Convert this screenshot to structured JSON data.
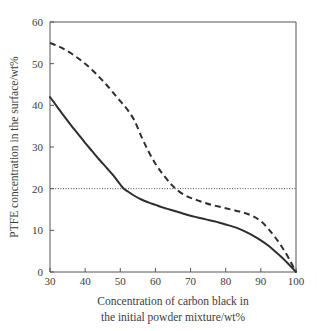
{
  "chart_data": {
    "type": "line",
    "title": "",
    "subtitle": "",
    "xlabel_line1": "Concentration of carbon black in",
    "xlabel_line2": "the initial powder mixture/wt%",
    "ylabel": "PTFE concentration in the surface/wt%",
    "xlim": [
      30,
      100
    ],
    "ylim": [
      0,
      60
    ],
    "xticks": [
      30,
      40,
      50,
      60,
      70,
      80,
      90,
      100
    ],
    "yticks": [
      0,
      10,
      20,
      30,
      40,
      50,
      60
    ],
    "xticklabels": [
      "30",
      "40",
      "50",
      "60",
      "70",
      "80",
      "90",
      "100"
    ],
    "yticklabels": [
      "0",
      "10",
      "20",
      "30",
      "40",
      "50",
      "60"
    ],
    "grid": false,
    "legend": "none",
    "annotations": [
      {
        "name": "reference-line-20",
        "kind": "horizontal-dotted-line",
        "y": 20,
        "label": ""
      }
    ],
    "series": [
      {
        "name": "dashed-curve",
        "style": "dashed",
        "color": "#2e2e2e",
        "x": [
          30,
          32,
          34,
          36,
          38,
          40,
          42,
          44,
          46,
          48,
          50,
          52,
          54,
          56,
          58,
          60,
          62,
          64,
          65,
          66,
          68,
          70,
          72,
          74,
          76,
          78,
          80,
          82,
          84,
          86,
          88,
          90,
          92,
          94,
          96,
          98,
          100
        ],
        "y": [
          55.0,
          54.3,
          53.5,
          52.5,
          51.3,
          50.0,
          48.5,
          46.8,
          45.0,
          43.0,
          41.0,
          39.0,
          36.4,
          32.5,
          29.0,
          26.0,
          23.6,
          21.5,
          20.6,
          19.8,
          18.6,
          17.8,
          17.2,
          16.6,
          16.1,
          15.7,
          15.3,
          14.9,
          14.5,
          14.0,
          13.3,
          12.2,
          10.5,
          8.4,
          6.0,
          3.2,
          0.0
        ]
      },
      {
        "name": "solid-curve",
        "style": "solid",
        "color": "#2e2e2e",
        "x": [
          30,
          32,
          34,
          36,
          38,
          40,
          42,
          44,
          46,
          48,
          50,
          51,
          52,
          54,
          56,
          58,
          60,
          62,
          64,
          66,
          68,
          70,
          72,
          74,
          76,
          78,
          80,
          82,
          84,
          86,
          88,
          90,
          92,
          94,
          96,
          98,
          100
        ],
        "y": [
          42.0,
          39.7,
          37.4,
          35.2,
          33.1,
          31.0,
          29.0,
          27.0,
          25.1,
          23.2,
          21.0,
          20.0,
          19.4,
          18.3,
          17.4,
          16.7,
          16.1,
          15.5,
          15.0,
          14.5,
          14.0,
          13.5,
          13.1,
          12.7,
          12.3,
          11.9,
          11.4,
          10.9,
          10.3,
          9.5,
          8.6,
          7.6,
          6.4,
          5.0,
          3.5,
          1.8,
          0.0
        ]
      }
    ]
  },
  "plot_geometry": {
    "left_px": 50,
    "right_px": 296,
    "top_px": 22,
    "bottom_px": 272
  }
}
